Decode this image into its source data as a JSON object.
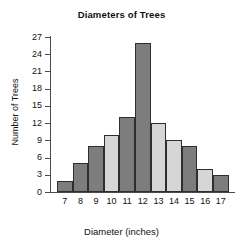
{
  "chart_data": {
    "type": "bar",
    "title": "Diameters of Trees",
    "xlabel": "Diameter (inches)",
    "ylabel": "Number of Trees",
    "categories": [
      "7",
      "8",
      "9",
      "10",
      "11",
      "12",
      "13",
      "14",
      "15",
      "16",
      "17"
    ],
    "values": [
      2,
      5,
      8,
      10,
      13,
      26,
      12,
      9,
      8,
      4,
      3
    ],
    "bar_shades": [
      "dark",
      "dark",
      "dark",
      "light",
      "dark",
      "dark",
      "light",
      "light",
      "dark",
      "light",
      "dark"
    ],
    "ylim": [
      0,
      27
    ],
    "xlim_note": "categorical, one bar per inch value 7-17",
    "yticks": [
      0,
      3,
      6,
      9,
      12,
      15,
      18,
      21,
      24,
      27
    ],
    "ytick_labels": [
      "0",
      "3",
      "6",
      "9",
      "12",
      "15",
      "18",
      "21",
      "24",
      "27"
    ],
    "grid": false,
    "legend": null,
    "colors": {
      "bar_dark": "#7d7d7d",
      "bar_light": "#d6d6d6",
      "bar_outline": "#2e2e2e",
      "axis": "#4a4a4a",
      "text": "#111111",
      "background": "#ffffff"
    }
  }
}
